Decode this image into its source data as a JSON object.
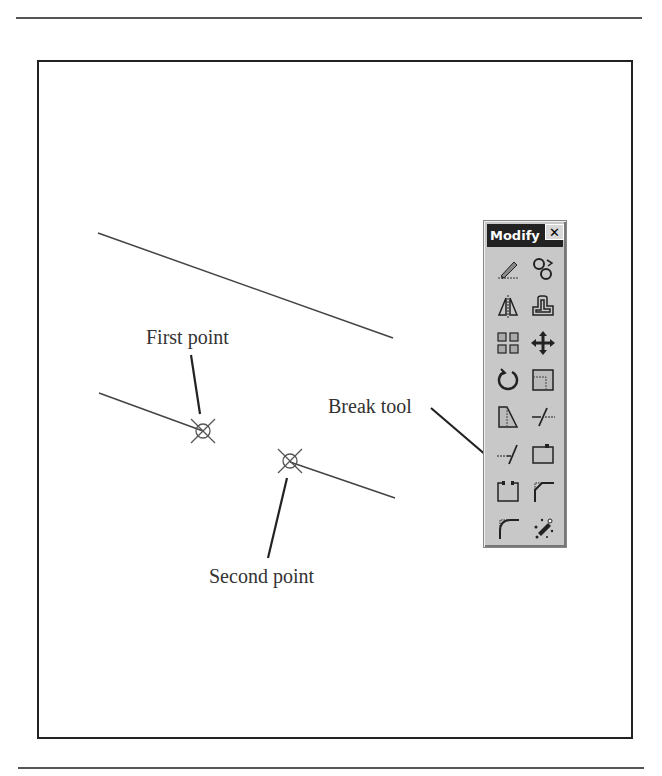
{
  "figure": {
    "labels": {
      "first_point": "First point",
      "second_point": "Second point",
      "break_tool": "Break tool"
    }
  },
  "toolbar": {
    "title": "Modify",
    "close_glyph": "✕",
    "buttons": [
      {
        "name": "erase-icon",
        "tool": "Erase"
      },
      {
        "name": "copy-icon",
        "tool": "Copy"
      },
      {
        "name": "mirror-icon",
        "tool": "Mirror"
      },
      {
        "name": "offset-icon",
        "tool": "Offset"
      },
      {
        "name": "array-icon",
        "tool": "Array"
      },
      {
        "name": "move-icon",
        "tool": "Move"
      },
      {
        "name": "rotate-icon",
        "tool": "Rotate"
      },
      {
        "name": "scale-icon",
        "tool": "Scale"
      },
      {
        "name": "stretch-icon",
        "tool": "Stretch"
      },
      {
        "name": "trim-icon",
        "tool": "Trim"
      },
      {
        "name": "extend-icon",
        "tool": "Extend"
      },
      {
        "name": "break-at-point-icon",
        "tool": "Break at Point"
      },
      {
        "name": "break-icon",
        "tool": "Break"
      },
      {
        "name": "chamfer-icon",
        "tool": "Chamfer"
      },
      {
        "name": "fillet-icon",
        "tool": "Fillet"
      },
      {
        "name": "explode-icon",
        "tool": "Explode"
      }
    ]
  },
  "colors": {
    "line": "#333333",
    "toolbar_bg": "#c8c8c8",
    "titlebar_bg": "#222222"
  }
}
